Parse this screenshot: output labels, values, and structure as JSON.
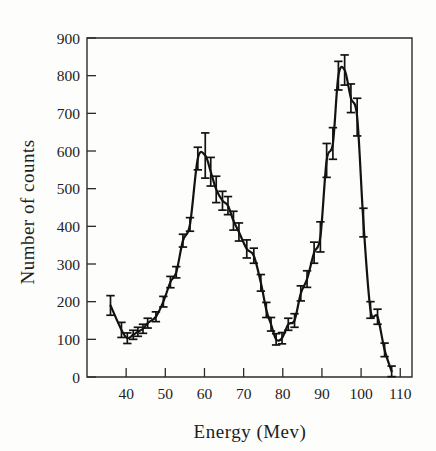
{
  "figure": {
    "background_color": "#fdfdfc",
    "ink_color": "#121212"
  },
  "chart_data": {
    "type": "line",
    "title": "",
    "subtitle": "",
    "xlabel": "Energy (Mev)",
    "ylabel": "Number of counts",
    "xlim": [
      30,
      113
    ],
    "ylim": [
      0,
      900
    ],
    "grid": false,
    "legend": null,
    "legend_position": "none",
    "x_ticks": [
      40,
      50,
      60,
      70,
      80,
      90,
      100,
      110
    ],
    "x_tick_labels": [
      "40",
      "50",
      "60",
      "70",
      "80",
      "90",
      "100",
      "110"
    ],
    "y_ticks": [
      0,
      100,
      200,
      300,
      400,
      500,
      600,
      700,
      800,
      900
    ],
    "y_tick_labels": [
      "0",
      "100",
      "200",
      "300",
      "400",
      "500",
      "600",
      "700",
      "800",
      "900"
    ],
    "series": [
      {
        "name": "counts",
        "marker": "errorbar",
        "connected": true,
        "x": [
          36.0,
          38.8,
          40.3,
          41.8,
          43.0,
          44.3,
          45.5,
          47.6,
          49.5,
          51.3,
          52.8,
          54.5,
          56.3,
          58.3,
          60.2,
          61.6,
          63.0,
          64.6,
          66.0,
          67.4,
          68.8,
          70.8,
          72.6,
          74.4,
          75.8,
          77.0,
          78.3,
          79.8,
          81.4,
          83.0,
          84.6,
          86.2,
          88.0,
          89.6,
          91.2,
          92.8,
          94.2,
          95.8,
          97.4,
          99.0,
          100.6,
          102.4,
          104.2,
          106.0,
          107.8
        ],
        "y": [
          190,
          125,
          103,
          112,
          120,
          128,
          143,
          160,
          200,
          252,
          278,
          362,
          405,
          580,
          588,
          545,
          498,
          468,
          455,
          415,
          385,
          340,
          322,
          250,
          178,
          140,
          100,
          103,
          140,
          150,
          222,
          260,
          330,
          372,
          575,
          620,
          800,
          815,
          740,
          690,
          410,
          178,
          160,
          72,
          15
        ],
        "yerr": [
          26,
          20,
          14,
          12,
          12,
          12,
          13,
          13,
          14,
          15,
          15,
          17,
          18,
          30,
          60,
          38,
          35,
          25,
          24,
          25,
          24,
          24,
          20,
          22,
          20,
          18,
          15,
          15,
          16,
          18,
          20,
          22,
          28,
          40,
          45,
          42,
          38,
          40,
          38,
          50,
          38,
          22,
          20,
          18,
          14
        ]
      }
    ],
    "annotations": [],
    "peaks": [
      {
        "label": "peak-1",
        "x": 59,
        "y": 588
      },
      {
        "label": "peak-2",
        "x": 95,
        "y": 815
      }
    ],
    "valley": {
      "label": "valley",
      "x": 78,
      "y": 100
    }
  }
}
